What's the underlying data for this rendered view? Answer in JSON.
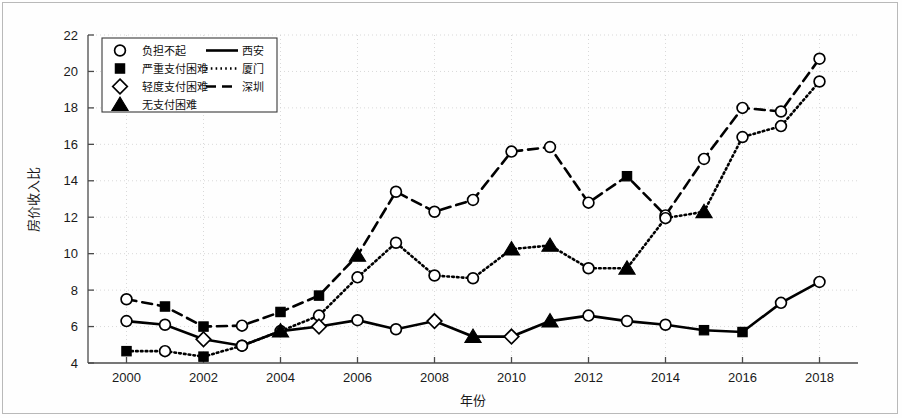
{
  "chart_data": {
    "type": "line",
    "title": "",
    "xlabel": "年份",
    "ylabel": "房价收入比",
    "xlim": [
      1999,
      2019
    ],
    "ylim": [
      4,
      22
    ],
    "xticks": [
      2000,
      2002,
      2004,
      2006,
      2008,
      2010,
      2012,
      2014,
      2016,
      2018
    ],
    "yticks": [
      4,
      6,
      8,
      10,
      12,
      14,
      16,
      18,
      20,
      22
    ],
    "grid": true,
    "legend_position": "top-left",
    "x": [
      2000,
      2001,
      2002,
      2003,
      2004,
      2005,
      2006,
      2007,
      2008,
      2009,
      2010,
      2011,
      2012,
      2013,
      2014,
      2015,
      2016,
      2017,
      2018
    ],
    "series": [
      {
        "name": "西安",
        "line_style": "solid",
        "values": [
          6.3,
          6.1,
          5.3,
          4.95,
          5.75,
          6.0,
          6.35,
          5.85,
          6.3,
          5.45,
          5.45,
          6.3,
          6.6,
          6.3,
          6.1,
          5.8,
          5.7,
          7.3,
          8.45
        ],
        "markers": [
          "circle",
          "circle",
          "diamond",
          "circle",
          "triangle",
          "diamond",
          "circle",
          "circle",
          "diamond",
          "triangle",
          "diamond",
          "triangle",
          "circle",
          "circle",
          "circle",
          "square",
          "square",
          "circle",
          "circle"
        ]
      },
      {
        "name": "厦门",
        "line_style": "dotted",
        "values": [
          4.65,
          4.65,
          4.35,
          4.95,
          5.75,
          6.6,
          8.7,
          10.6,
          8.8,
          8.65,
          10.25,
          10.45,
          9.2,
          9.2,
          11.95,
          12.3,
          16.4,
          17.0,
          19.45
        ],
        "markers": [
          "square",
          "circle",
          "square",
          "circle",
          "circle",
          "circle",
          "circle",
          "circle",
          "circle",
          "circle",
          "triangle",
          "triangle",
          "circle",
          "triangle",
          "circle",
          "triangle",
          "circle",
          "circle",
          "circle"
        ]
      },
      {
        "name": "深圳",
        "line_style": "dashed",
        "values": [
          7.5,
          7.1,
          6.0,
          6.05,
          6.8,
          7.7,
          9.9,
          13.4,
          12.3,
          12.95,
          15.6,
          15.85,
          12.8,
          14.25,
          12.1,
          15.2,
          18.0,
          17.8,
          20.7
        ],
        "markers": [
          "circle",
          "square",
          "square",
          "circle",
          "square",
          "square",
          "triangle",
          "circle",
          "circle",
          "circle",
          "circle",
          "circle",
          "circle",
          "square",
          "circle",
          "circle",
          "circle",
          "circle",
          "circle"
        ]
      }
    ]
  },
  "legend": {
    "marker_entries": [
      {
        "marker": "circle",
        "label": "负担不起"
      },
      {
        "marker": "square",
        "label": "严重支付困难"
      },
      {
        "marker": "diamond",
        "label": "轻度支付困难"
      },
      {
        "marker": "triangle",
        "label": "无支付困难"
      }
    ],
    "line_entries": [
      {
        "style": "solid",
        "label": "西安"
      },
      {
        "style": "dotted",
        "label": "厦门"
      },
      {
        "style": "dashed",
        "label": "深圳"
      }
    ]
  },
  "colors": {
    "line": "#000000",
    "marker_fill_open": "#ffffff",
    "marker_fill_closed": "#000000",
    "grid": "#cfcfcf",
    "axis": "#4a4a4a",
    "frame": "#b9b9b9",
    "background": "#fefefe"
  }
}
